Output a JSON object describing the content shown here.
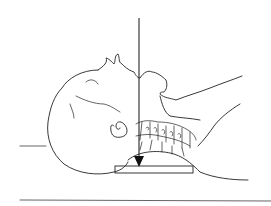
{
  "figure": {
    "arrow": {
      "direction": "down",
      "x": 139,
      "y_start": 18,
      "y_end": 167
    },
    "colors": {
      "line": "#222222",
      "background": "#ffffff",
      "pad_fill": "#ffffff"
    }
  }
}
